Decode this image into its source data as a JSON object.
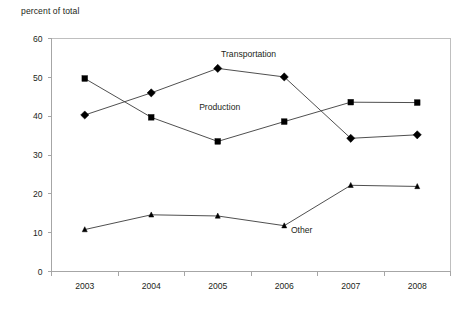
{
  "chart_data": {
    "type": "line",
    "title": "",
    "ylabel": "percent of total",
    "xlabel": "",
    "categories": [
      "2003",
      "2004",
      "2005",
      "2006",
      "2007",
      "2008"
    ],
    "ylim": [
      0,
      60
    ],
    "yticks": [
      0,
      10,
      20,
      30,
      40,
      50,
      60
    ],
    "ytick_labels": [
      "0",
      "10",
      "20",
      "30",
      "40",
      "50",
      "60"
    ],
    "grid": false,
    "legend_position": "inline-annotations",
    "series": [
      {
        "name": "Production",
        "marker": "square",
        "values": [
          49.7,
          39.7,
          33.5,
          38.6,
          43.6,
          43.5
        ]
      },
      {
        "name": "Transportation",
        "marker": "diamond",
        "values": [
          40.3,
          46.0,
          52.3,
          50.1,
          34.3,
          35.2
        ]
      },
      {
        "name": "Other",
        "marker": "triangle",
        "values": [
          10.8,
          14.6,
          14.3,
          11.8,
          22.2,
          21.9
        ]
      }
    ],
    "annotations": [
      {
        "text": "Transportation",
        "x": 2.05,
        "y": 55.2,
        "anchor": "start"
      },
      {
        "text": "Production",
        "x": 1.72,
        "y": 41.6,
        "anchor": "start"
      },
      {
        "text": "Other",
        "x": 3.1,
        "y": 9.9,
        "anchor": "start"
      }
    ],
    "colors": {
      "marker": "#000000",
      "line": "#3b3b3b",
      "axis": "#a6a6a6",
      "border": "#bfbfbf",
      "text": "#231f20"
    }
  }
}
